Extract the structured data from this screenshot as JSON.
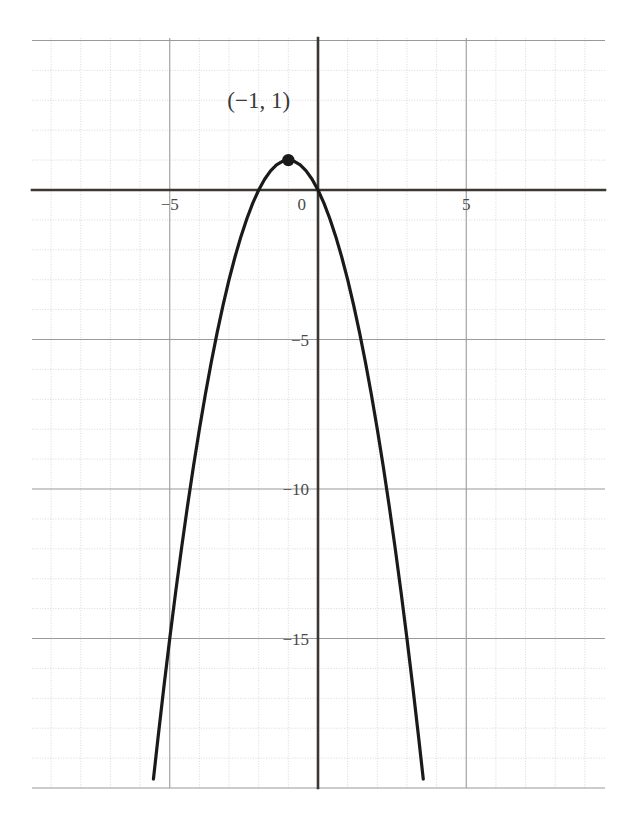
{
  "chart_data": {
    "type": "line",
    "title": "",
    "subtitle": "",
    "xlabel": "",
    "ylabel": "",
    "xlim": [
      -9.66,
      9.7
    ],
    "ylim": [
      -20.0,
      5.08
    ],
    "grid": true,
    "minor_grid_step": 1,
    "major_grid_step": 5,
    "legend": "none",
    "function": "y = -x^2 - 2x",
    "vertex_form": "y = 1 - (x + 1)^2",
    "xticks": [
      -5,
      0,
      5
    ],
    "xtick_labels": [
      "−5",
      "0",
      "5"
    ],
    "yticks": [
      -5,
      -10,
      -15
    ],
    "ytick_labels": [
      "−5",
      "−10",
      "−15"
    ],
    "series": [
      {
        "name": "parabola",
        "color": "#1a1a1a",
        "x": [
          -5.55,
          -5.4,
          -5.2,
          -5.0,
          -4.8,
          -4.6,
          -4.4,
          -4.2,
          -4.0,
          -3.8,
          -3.6,
          -3.4,
          -3.2,
          -3.0,
          -2.8,
          -2.6,
          -2.4,
          -2.2,
          -2.0,
          -1.8,
          -1.6,
          -1.4,
          -1.2,
          -1.0,
          -0.8,
          -0.6,
          -0.4,
          -0.2,
          0.0,
          0.2,
          0.4,
          0.6,
          0.8,
          1.0,
          1.2,
          1.4,
          1.6,
          1.8,
          2.0,
          2.2,
          2.4,
          2.6,
          2.8,
          3.0,
          3.2,
          3.4,
          3.55
        ],
        "y": [
          -19.7,
          -18.36,
          -16.64,
          -15.0,
          -13.44,
          -11.96,
          -10.56,
          -9.24,
          -8.0,
          -6.84,
          -5.76,
          -4.76,
          -3.84,
          -3.0,
          -2.24,
          -1.56,
          -0.96,
          -0.44,
          0.0,
          0.36,
          0.64,
          0.84,
          0.96,
          1.0,
          0.96,
          0.84,
          0.64,
          0.36,
          0.0,
          -0.44,
          -0.96,
          -1.56,
          -2.24,
          -3.0,
          -3.84,
          -4.76,
          -5.76,
          -6.84,
          -8.0,
          -9.24,
          -10.56,
          -11.96,
          -13.44,
          -15.0,
          -16.64,
          -18.36,
          -19.7
        ]
      }
    ],
    "annotations": [
      {
        "name": "vertex",
        "label": "(−1, 1)",
        "x": -1,
        "y": 1,
        "marker": "filled-circle",
        "marker_color": "#1a1a1a",
        "label_offset_x": -1.0,
        "label_offset_y": 1.75
      }
    ],
    "colors": {
      "curve": "#1a1a1a",
      "axis": "#3b3733",
      "major_grid": "#9a9a9a",
      "minor_grid": "#c9c9c9",
      "tick_text": "#4a4a4a",
      "background": "#ffffff"
    }
  }
}
